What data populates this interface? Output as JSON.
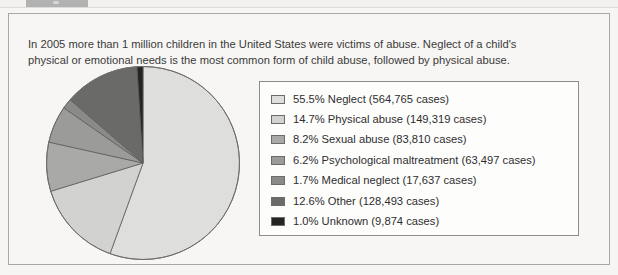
{
  "document": {
    "intro_line1": "In 2005 more than 1 million children in the United States were victims of abuse. Neglect of a child's",
    "intro_line2": "physical or emotional needs is the most common form of child abuse, followed by physical abuse."
  },
  "chart_data": {
    "type": "pie",
    "title": "",
    "legend_position": "right",
    "start_angle_deg": 0,
    "direction": "clockwise",
    "total_cases": 1017405,
    "categories": [
      "Neglect",
      "Physical abuse",
      "Sexual abuse",
      "Psychological maltreatment",
      "Medical neglect",
      "Other",
      "Unknown"
    ],
    "values": [
      55.5,
      14.7,
      8.2,
      6.2,
      1.7,
      12.6,
      1.0
    ],
    "cases": [
      564765,
      149319,
      83810,
      63497,
      17637,
      128493,
      9874
    ],
    "colors": [
      "#dededc",
      "#d2d2d0",
      "#a9a9a7",
      "#9b9b99",
      "#8a8a88",
      "#6a6a68",
      "#242422"
    ],
    "legend_entries": [
      "55.5% Neglect (564,765 cases)",
      "14.7% Physical abuse (149,319 cases)",
      "8.2% Sexual abuse (83,810 cases)",
      "6.2% Psychological maltreatment (63,497 cases)",
      "1.7% Medical neglect (17,637 cases)",
      "12.6% Other (128,493 cases)",
      "1.0% Unknown (9,874 cases)"
    ]
  }
}
